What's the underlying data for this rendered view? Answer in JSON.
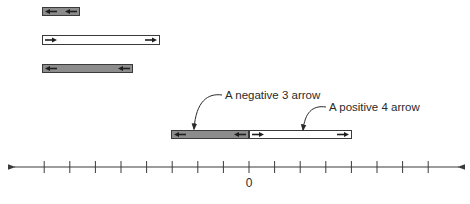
{
  "diagram": {
    "type": "number-line-arrows",
    "number_line": {
      "origin_label": "0",
      "tick_count": 16,
      "unit_px": 25.6,
      "origin_x": 249,
      "y": 167,
      "x_start": 14,
      "x_end": 459,
      "bidirectional": true
    },
    "bars": [
      {
        "id": "bar-1",
        "sign": "negative",
        "x": 42,
        "y": 7,
        "w": 37,
        "h": 8,
        "fill": "#8c8c8c",
        "arrow_direction": "left"
      },
      {
        "id": "bar-2",
        "sign": "positive",
        "x": 42,
        "y": 35,
        "w": 117,
        "h": 9,
        "fill": "#ffffff",
        "arrow_direction": "right"
      },
      {
        "id": "bar-3",
        "sign": "negative",
        "x": 42,
        "y": 64,
        "w": 90,
        "h": 8,
        "fill": "#8c8c8c",
        "arrow_direction": "left"
      },
      {
        "id": "bar-neg3",
        "sign": "negative",
        "value": -3,
        "x": 171,
        "y": 130,
        "w": 77,
        "h": 8,
        "fill": "#8c8c8c",
        "arrow_direction": "left"
      },
      {
        "id": "bar-pos4",
        "sign": "positive",
        "value": 4,
        "x": 249,
        "y": 130,
        "w": 102,
        "h": 8,
        "fill": "#ffffff",
        "arrow_direction": "right"
      }
    ],
    "callouts": [
      {
        "id": "callout-negative",
        "text": "A negative 3 arrow",
        "text_x": 225,
        "text_y": 99,
        "target_x": 194,
        "target_y": 130
      },
      {
        "id": "callout-positive",
        "text": "A positive 4 arrow",
        "text_x": 329,
        "text_y": 111,
        "target_x": 303,
        "target_y": 131
      }
    ],
    "colors": {
      "line": "#3a3a3a",
      "negative_fill": "#8c8c8c",
      "positive_fill": "#ffffff",
      "border": "#3a3a3a",
      "text": "#2a2a2a"
    }
  }
}
